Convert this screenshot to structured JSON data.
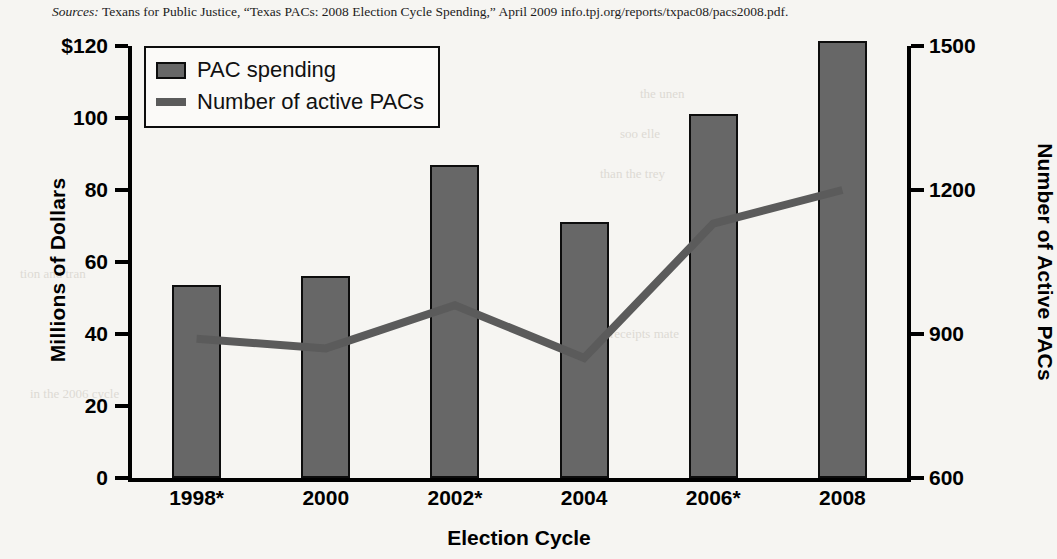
{
  "source_note": {
    "label": "Sources:",
    "text": "Texans for Public Justice, “Texas PACs: 2008 Election Cycle Spending,” April 2009 info.tpj.org/reports/txpac08/pacs2008.pdf."
  },
  "legend": {
    "position": "top-left-inside",
    "items": [
      {
        "label": "PAC spending",
        "marker": "bar-swatch-icon",
        "color": "#676767"
      },
      {
        "label": "Number of active PACs",
        "marker": "line-swatch-icon",
        "color": "#5b5b5b"
      }
    ]
  },
  "colors": {
    "bar_fill": "#676767",
    "bar_stroke": "#0d0d0d",
    "line": "#5b5b5b",
    "axis": "#000000",
    "page_background": "#f6f5f2"
  },
  "chart_data": {
    "type": "bar",
    "title": "",
    "subtitle": "",
    "xlabel": "Election Cycle",
    "ylabel": "Millions of Dollars",
    "y2label": "Number of Active PACs",
    "categories": [
      "1998*",
      "2000",
      "2002*",
      "2004",
      "2006*",
      "2008"
    ],
    "grid": false,
    "legend_position": "upper left",
    "ylim": [
      0,
      120
    ],
    "yticks": [
      0,
      20,
      40,
      60,
      80,
      100,
      120
    ],
    "ytick_labels": [
      "0",
      "20",
      "40",
      "60",
      "80",
      "100",
      "$120"
    ],
    "y2lim": [
      600,
      1500
    ],
    "y2ticks": [
      600,
      900,
      1200,
      1500
    ],
    "y2tick_labels": [
      "600",
      "900",
      "1200",
      "1500"
    ],
    "series": [
      {
        "name": "PAC spending",
        "type": "bar",
        "axis": "left",
        "unit": "millions of dollars",
        "values": [
          53.5,
          56,
          87,
          71,
          101,
          121.5
        ]
      },
      {
        "name": "Number of active PACs",
        "type": "line",
        "axis": "right",
        "unit": "count",
        "values": [
          890,
          870,
          960,
          850,
          1130,
          1200
        ]
      }
    ]
  },
  "ghost_text": [
    "the unen",
    "soo elle",
    "than the trey",
    "tion and tran",
    "receipts mate",
    "in the 2006 cycle",
    "it was can be",
    "a 2002 cycle",
    "ments of 1998"
  ]
}
